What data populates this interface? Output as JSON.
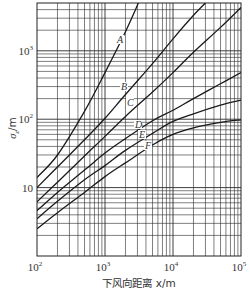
{
  "chart_data": {
    "type": "line",
    "title": "",
    "xlabel": "下风向距离 x/m",
    "ylabel": "σz/m",
    "xscale": "log",
    "yscale": "log",
    "xlim": [
      100,
      100000
    ],
    "ylim": [
      1,
      5000
    ],
    "grid": true,
    "legend": "inline labels on curves",
    "x_ticks": [
      {
        "base": "10",
        "exp": "2",
        "value": 100
      },
      {
        "base": "10",
        "exp": "3",
        "value": 1000
      },
      {
        "base": "10",
        "exp": "4",
        "value": 10000
      },
      {
        "base": "10",
        "exp": "5",
        "value": 100000
      }
    ],
    "y_ticks": [
      {
        "base": "10",
        "exp": "",
        "value": 10
      },
      {
        "base": "10",
        "exp": "2",
        "value": 100
      },
      {
        "base": "10",
        "exp": "3",
        "value": 1000
      }
    ],
    "series": [
      {
        "name": "A",
        "x": [
          100,
          200,
          500,
          1000,
          2000,
          3100
        ],
        "values": [
          14,
          30,
          130,
          480,
          1900,
          5000
        ],
        "label_pos": {
          "x": 117,
          "y": 43
        }
      },
      {
        "name": "B",
        "x": [
          100,
          200,
          500,
          1000,
          2000,
          5000,
          10000,
          20000,
          30000
        ],
        "values": [
          10,
          20,
          50,
          103,
          230,
          650,
          1500,
          3300,
          5000
        ],
        "label_pos": {
          "x": 121,
          "y": 90
        }
      },
      {
        "name": "C",
        "x": [
          100,
          200,
          500,
          1000,
          2000,
          5000,
          10000,
          20000,
          50000,
          100000
        ],
        "values": [
          6.2,
          12,
          29,
          56,
          110,
          250,
          480,
          950,
          2200,
          4300
        ],
        "label_pos": {
          "x": 127,
          "y": 106
        }
      },
      {
        "name": "D",
        "x": [
          100,
          200,
          500,
          1000,
          2000,
          5000,
          10000,
          20000,
          50000,
          100000
        ],
        "values": [
          4.6,
          8.5,
          18,
          32,
          52,
          95,
          135,
          200,
          330,
          480
        ],
        "label_pos": {
          "x": 135,
          "y": 128
        }
      },
      {
        "name": "E",
        "x": [
          100,
          200,
          500,
          1000,
          2000,
          5000,
          10000,
          20000,
          50000,
          100000
        ],
        "values": [
          3.5,
          6.3,
          13,
          21,
          35,
          62,
          93,
          120,
          160,
          190
        ],
        "label_pos": {
          "x": 139,
          "y": 138
        }
      },
      {
        "name": "F",
        "x": [
          100,
          200,
          500,
          1000,
          2000,
          5000,
          10000,
          20000,
          50000,
          100000
        ],
        "values": [
          2.5,
          4.3,
          8.5,
          14.5,
          23,
          42,
          60,
          75,
          90,
          98
        ],
        "label_pos": {
          "x": 145,
          "y": 149
        }
      }
    ]
  },
  "colors": {
    "curve": "#1a1a1a",
    "grid": "#2a2a2a",
    "text": "#333333"
  }
}
